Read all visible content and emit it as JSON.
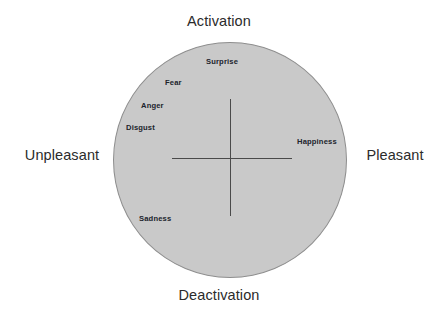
{
  "figure": {
    "type": "circumplex-model-of-affect",
    "background_color": "#ffffff",
    "circle_fill_color": "#c9c9c9",
    "circle_stroke_color": "#8e8e8e",
    "axis_color": "#4a4a4a",
    "label_color": "#2b2b2b",
    "emotion_label_color": "#20242c"
  },
  "dimensions": {
    "top": "Activation",
    "bottom": "Deactivation",
    "left": "Unpleasant",
    "right": "Pleasant"
  },
  "emotions": [
    {
      "label": "Surprise",
      "left": 206,
      "top": 57,
      "quadrant": "activation-neutral"
    },
    {
      "label": "Fear",
      "left": 165,
      "top": 78,
      "quadrant": "activation-unpleasant"
    },
    {
      "label": "Anger",
      "left": 141,
      "top": 101,
      "quadrant": "activation-unpleasant"
    },
    {
      "label": "Disgust",
      "left": 126,
      "top": 123,
      "quadrant": "activation-unpleasant"
    },
    {
      "label": "Happiness",
      "left": 297,
      "top": 137,
      "quadrant": "pleasant"
    },
    {
      "label": "Sadness",
      "left": 139,
      "top": 214,
      "quadrant": "deactivation-unpleasant"
    }
  ],
  "chart_data": {
    "type": "scatter",
    "title": "",
    "xlabel": "Valence",
    "ylabel": "Arousal",
    "xlim": [
      -1,
      1
    ],
    "ylim": [
      -1,
      1
    ],
    "grid": false,
    "legend": false,
    "axis_endpoint_labels": {
      "x_negative": "Unpleasant",
      "x_positive": "Pleasant",
      "y_positive": "Activation",
      "y_negative": "Deactivation"
    },
    "points": [
      {
        "label": "Surprise",
        "x": -0.05,
        "y": 0.83
      },
      {
        "label": "Fear",
        "x": -0.45,
        "y": 0.66
      },
      {
        "label": "Anger",
        "x": -0.66,
        "y": 0.47
      },
      {
        "label": "Disgust",
        "x": -0.78,
        "y": 0.29
      },
      {
        "label": "Happiness",
        "x": 0.64,
        "y": 0.14
      },
      {
        "label": "Sadness",
        "x": -0.61,
        "y": -0.49
      }
    ]
  }
}
